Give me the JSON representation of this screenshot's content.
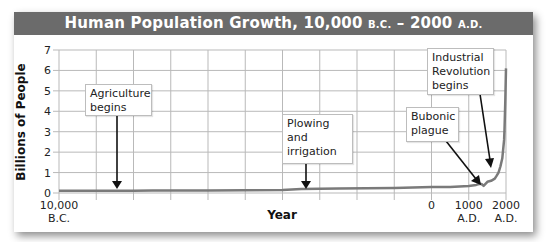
{
  "chart_data": {
    "type": "line",
    "title": "Human Population Growth, 10,000 B.C. – 2000 A.D.",
    "title_parts": {
      "main": "Human Population Growth, 10,000 ",
      "bc": "B.C.",
      "dash": " – 2000 ",
      "ad": "A.D."
    },
    "xlabel": "Year",
    "ylabel": "Billions of People",
    "ylim": [
      0,
      7
    ],
    "yticks": [
      "0",
      "1",
      "2",
      "3",
      "4",
      "5",
      "6",
      "7"
    ],
    "xlim": [
      -10000,
      2000
    ],
    "xtick_labels": [
      {
        "year": -10000,
        "line1": "10,000",
        "line2": "B.C."
      },
      {
        "year": 0,
        "line1": "0",
        "line2": ""
      },
      {
        "year": 1000,
        "line1": "1000",
        "line2": "A.D."
      },
      {
        "year": 2000,
        "line1": "2000",
        "line2": "A.D."
      }
    ],
    "grid": true,
    "series": [
      {
        "name": "World population",
        "color": "#7a7a7a",
        "x": [
          -10000,
          -8000,
          -7500,
          -6000,
          -4000,
          -3500,
          -2500,
          -1000,
          0,
          500,
          1000,
          1200,
          1300,
          1350,
          1400,
          1500,
          1600,
          1700,
          1750,
          1800,
          1850,
          1900,
          1950,
          1960,
          1980,
          2000
        ],
        "y": [
          0.01,
          0.01,
          0.02,
          0.03,
          0.05,
          0.1,
          0.12,
          0.15,
          0.2,
          0.2,
          0.25,
          0.3,
          0.35,
          0.33,
          0.25,
          0.45,
          0.5,
          0.6,
          0.75,
          0.9,
          1.2,
          1.6,
          2.5,
          3.0,
          4.4,
          6.0
        ]
      }
    ],
    "annotations": [
      {
        "text_lines": [
          "Agriculture",
          "begins"
        ],
        "year": -8000
      },
      {
        "text_lines": [
          "Plowing",
          "and",
          "irrigation"
        ],
        "year": -3000
      },
      {
        "text_lines": [
          "Bubonic",
          "plague"
        ],
        "year": 1350
      },
      {
        "text_lines": [
          "Industrial",
          "Revolution",
          "begins"
        ],
        "year": 1750
      }
    ]
  },
  "colors": {
    "title_bar": "#6b6b6b",
    "title_text": "#ffffff",
    "grid": "#b9b9b9",
    "curve": "#7a7a7a",
    "arrow": "#111111"
  }
}
